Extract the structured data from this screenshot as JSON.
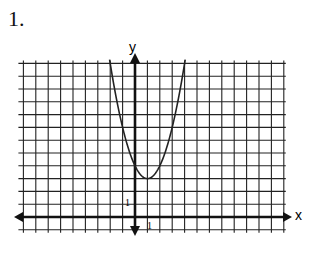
{
  "problem": {
    "number_label": "1."
  },
  "graph": {
    "x_axis_label": "x",
    "y_axis_label": "y",
    "x_unit_label": "1",
    "y_unit_label": "1",
    "grid": {
      "x_min": -9,
      "x_max": 12,
      "y_min": -1,
      "y_max": 12
    },
    "curve": {
      "type": "parabola",
      "equation": "y = (x - 1)^2 + 3",
      "vertex": [
        1,
        3
      ]
    },
    "colors": {
      "grid": "#222222",
      "axis": "#111111",
      "curve": "#222222"
    }
  }
}
